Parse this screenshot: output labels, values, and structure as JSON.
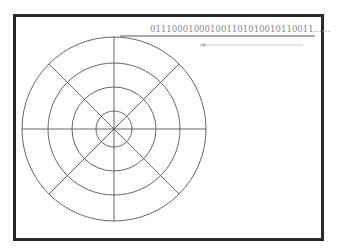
{
  "diagram": {
    "type": "polar-grid-with-bitstream",
    "bitstream_label": "011100010001001101010010110011......",
    "grid": {
      "center": [
        114,
        129
      ],
      "ring_radii": [
        92,
        66,
        42,
        18
      ],
      "spoke_count": 8
    },
    "colors": {
      "frame": "#2a2a2a",
      "grid_lines": "#555555",
      "bitstream_text": "#888888",
      "arrow": "#bbbbbb"
    },
    "arrow_direction": "left"
  }
}
